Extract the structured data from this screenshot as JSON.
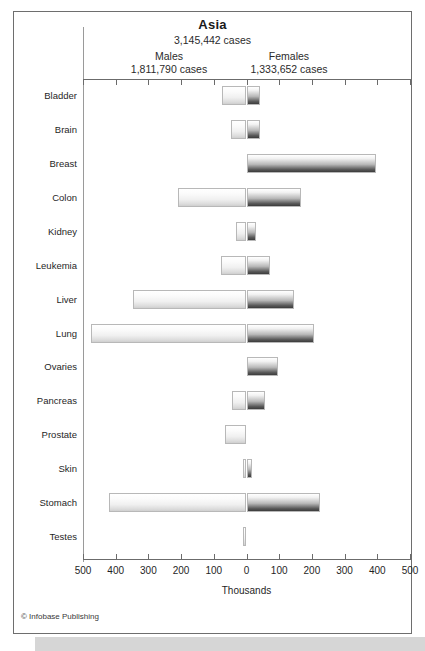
{
  "figure": {
    "title": "Asia",
    "total_cases": "3,145,442 cases",
    "males_label": "Males",
    "males_cases": "1,811,790 cases",
    "females_label": "Females",
    "females_cases": "1,333,652 cases",
    "x_axis_title": "Thousands",
    "credit": "© Infobase Publishing"
  },
  "chart_data": {
    "type": "bar",
    "orientation": "horizontal",
    "style": "population-pyramid / paired diverging bar",
    "title": "Asia",
    "subtitle": "3,145,442 cases",
    "xlabel": "Thousands",
    "ylabel": "",
    "xlim": [
      -500,
      500
    ],
    "xticks": [
      -500,
      -400,
      -300,
      -200,
      -100,
      0,
      100,
      200,
      300,
      400,
      500
    ],
    "xtick_labels": [
      "500",
      "400",
      "300",
      "200",
      "100",
      "0",
      "100",
      "200",
      "300",
      "400",
      "500"
    ],
    "grid": false,
    "legend": [
      "Males",
      "Females"
    ],
    "legend_position": "top",
    "units": "thousands of cases",
    "categories": [
      "Bladder",
      "Brain",
      "Breast",
      "Colon",
      "Kidney",
      "Leukemia",
      "Liver",
      "Lung",
      "Ovaries",
      "Pancreas",
      "Prostate",
      "Skin",
      "Stomach",
      "Testes"
    ],
    "series": [
      {
        "name": "Males",
        "total": "1,811,790 cases",
        "direction": "left",
        "values": [
          75,
          48,
          0,
          210,
          32,
          78,
          348,
          475,
          0,
          43,
          65,
          10,
          420,
          12
        ]
      },
      {
        "name": "Females",
        "total": "1,333,652 cases",
        "direction": "right",
        "values": [
          40,
          40,
          396,
          166,
          30,
          72,
          145,
          205,
          97,
          57,
          0,
          16,
          225,
          0
        ]
      }
    ]
  },
  "colors": {
    "male_bar": "#f0f0f0",
    "female_bar": "#5a5a5a",
    "border": "#6e6e6e",
    "axis": "#6b6b6b",
    "text": "#1f1f1f",
    "bottom_band": "#d6d6d6"
  }
}
